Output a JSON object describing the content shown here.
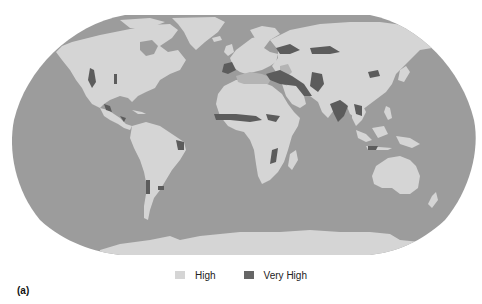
{
  "figure": {
    "panel_label": "(a)",
    "colors": {
      "ocean": "#9c9c9c",
      "land_high": "#d5d5d5",
      "very_high": "#5c5c5c",
      "inland_water": "#a8a8a8",
      "moderate": "#b4b4b4"
    },
    "legend": {
      "items": [
        {
          "label": "High",
          "color": "#d5d5d5"
        },
        {
          "label": "Very High",
          "color": "#666666"
        }
      ]
    },
    "projection": "Robinson"
  }
}
